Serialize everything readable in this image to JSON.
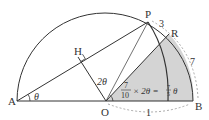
{
  "diagram": {
    "points": {
      "A": {
        "label": "A",
        "x": 17,
        "y": 101
      },
      "O": {
        "label": "O",
        "x": 106,
        "y": 101
      },
      "B": {
        "label": "B",
        "x": 193,
        "y": 101
      },
      "P": {
        "label": "P",
        "x": 148,
        "y": 22
      },
      "H": {
        "label": "H",
        "x": 78,
        "y": 57
      },
      "R": {
        "label": "R",
        "x": 169,
        "y": 34
      }
    },
    "labels": {
      "theta": "θ",
      "two_theta": "2θ",
      "arc_PR": "3",
      "arc_RB": "7",
      "arc_OB": "1",
      "frac_num": "7",
      "frac_den": "10",
      "times_expr": "× 2θ =",
      "result_num": "7",
      "result_den": "5",
      "result_var": "θ"
    },
    "colors": {
      "line": "#333333",
      "shade": "#d4d4d4",
      "dashed": "#888888"
    }
  }
}
